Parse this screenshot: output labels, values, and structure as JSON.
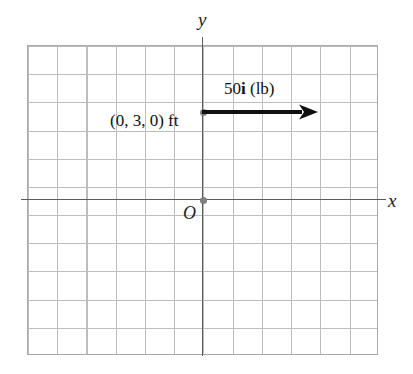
{
  "figure": {
    "type": "2d-coordinate-diagram",
    "background_color": "#ffffff",
    "grid": {
      "columns": 12,
      "rows": 11,
      "line_color": "#bdbdbd",
      "border_color": "#a8a8a8"
    },
    "axes": {
      "color": "#5a5a5a",
      "x_label": "x",
      "y_label": "y"
    },
    "origin": {
      "label": "O",
      "dot_color": "#808080"
    },
    "application_point": {
      "coordinate_label": "(0, 3, 0) ft",
      "dot_color": "#808080"
    },
    "force_vector": {
      "magnitude": "50",
      "direction_unit": "i",
      "units": "(lb)",
      "label_prefix": "50",
      "label_suffix": " (lb)",
      "color": "#101010"
    }
  }
}
